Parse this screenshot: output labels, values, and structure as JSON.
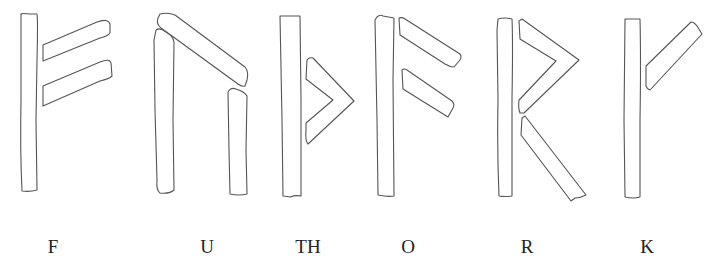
{
  "figure": {
    "stroke_color": "#555555",
    "background": "#ffffff",
    "runes": [
      {
        "id": "fehu",
        "label": "F",
        "label_x": 53
      },
      {
        "id": "uruz",
        "label": "U",
        "label_x": 207
      },
      {
        "id": "thurisaz",
        "label": "TH",
        "label_x": 308
      },
      {
        "id": "ansuz",
        "label": "O",
        "label_x": 408
      },
      {
        "id": "raidho",
        "label": "R",
        "label_x": 527
      },
      {
        "id": "kaunan",
        "label": "K",
        "label_x": 647
      }
    ]
  }
}
